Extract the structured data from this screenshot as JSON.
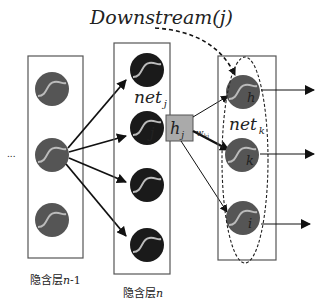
{
  "title": "Downstream(j)",
  "layers": {
    "prev": {
      "label": "隐含层n-1",
      "label_cn": "隐含层",
      "label_var": "n",
      "label_suffix": "-1"
    },
    "current": {
      "label": "隐含层n",
      "label_cn": "隐含层",
      "label_var": "n",
      "net_label": "net",
      "net_sub": "j",
      "node_label": "j"
    },
    "next": {
      "net_label": "net",
      "net_sub": "k",
      "node_labels": [
        "h",
        "k",
        "i"
      ]
    }
  },
  "output_box": {
    "label": "h",
    "sub": "j"
  },
  "weight": {
    "label": "w",
    "sub": "kj"
  },
  "ellipsis": "...",
  "colors": {
    "prev_node": "#555555",
    "current_node": "#1a1a1a",
    "next_node": "#555555",
    "curve": "#bbbbbb",
    "box_fill": "#aaaaaa",
    "line": "#111111"
  }
}
